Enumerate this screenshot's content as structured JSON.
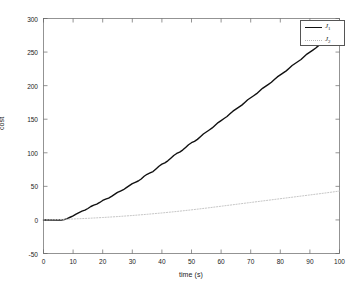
{
  "chart_data": {
    "type": "line",
    "title": "",
    "xlabel": "time (s)",
    "ylabel": "cost",
    "xlim": [
      0,
      100
    ],
    "ylim": [
      -50,
      300
    ],
    "xticks": [
      0,
      10,
      20,
      30,
      40,
      50,
      60,
      70,
      80,
      90,
      100
    ],
    "xticklabels": [
      "0",
      "10",
      "20",
      "30",
      "40",
      "50",
      "60",
      "70",
      "80",
      "90",
      "100"
    ],
    "yticks": [
      -50,
      0,
      50,
      100,
      150,
      200,
      250,
      300
    ],
    "yticklabels": [
      "-50",
      "0",
      "50",
      "100",
      "150",
      "200",
      "250",
      "300"
    ],
    "grid": false,
    "legend_position": "upper right",
    "series": [
      {
        "name": "J_1",
        "label_base": "J",
        "label_sub": "1",
        "style": "solid",
        "color": "#111111",
        "linewidth": 1.4,
        "description": "staircase accumulating cost",
        "x": [
          0,
          2,
          4,
          6,
          7,
          8,
          9,
          10,
          11,
          12,
          13,
          14,
          15,
          16,
          17,
          18,
          19,
          20,
          21,
          22,
          23,
          24,
          25,
          26,
          27,
          28,
          29,
          30,
          31,
          32,
          33,
          34,
          35,
          36,
          37,
          38,
          39,
          40,
          41,
          42,
          43,
          44,
          45,
          46,
          47,
          48,
          49,
          50,
          51,
          52,
          53,
          54,
          55,
          56,
          57,
          58,
          59,
          60,
          61,
          62,
          63,
          64,
          65,
          66,
          67,
          68,
          69,
          70,
          71,
          72,
          73,
          74,
          75,
          76,
          77,
          78,
          79,
          80,
          81,
          82,
          83,
          84,
          85,
          86,
          87,
          88,
          89,
          90,
          91,
          92,
          93,
          94,
          95,
          96,
          97,
          98,
          99,
          100
        ],
        "y": [
          0,
          0,
          0,
          0,
          0.5,
          2,
          4,
          6,
          8.5,
          11,
          13,
          14.5,
          17,
          20,
          22,
          23.5,
          26,
          29,
          31,
          32.5,
          35,
          38,
          41,
          43,
          45,
          48,
          51,
          54,
          56,
          58,
          61,
          65,
          68,
          70,
          72,
          76,
          80,
          83,
          85,
          88,
          92,
          96,
          99,
          101,
          104,
          108,
          112,
          115,
          117,
          120,
          124,
          128,
          131,
          134,
          137,
          141,
          145,
          148,
          151,
          154,
          158,
          162,
          165,
          168,
          171,
          175,
          179,
          182,
          185,
          188,
          192,
          196,
          199,
          202,
          205,
          209,
          213,
          216,
          219,
          222,
          226,
          230,
          233,
          236,
          239,
          243,
          247,
          250,
          253,
          256,
          260,
          263,
          265,
          267,
          269,
          270,
          272,
          274
        ]
      },
      {
        "name": "J_2",
        "label_base": "J",
        "label_sub": "2",
        "style": "dotted",
        "color": "#c0c0c0",
        "linewidth": 0.9,
        "description": "smooth gradually increasing cost",
        "x": [
          0,
          5,
          10,
          15,
          20,
          25,
          30,
          35,
          40,
          45,
          50,
          55,
          60,
          65,
          70,
          75,
          80,
          85,
          90,
          95,
          100
        ],
        "y": [
          0,
          0.6,
          1.4,
          2.4,
          3.6,
          5.0,
          6.6,
          8.4,
          10.4,
          12.6,
          15.0,
          17.6,
          20.4,
          23.2,
          26.0,
          28.8,
          31.6,
          34.4,
          37.2,
          40.0,
          43.0
        ]
      }
    ]
  },
  "legend": {
    "entries": [
      {
        "label_base": "J",
        "label_sub": "1"
      },
      {
        "label_base": "J",
        "label_sub": "2"
      }
    ]
  }
}
